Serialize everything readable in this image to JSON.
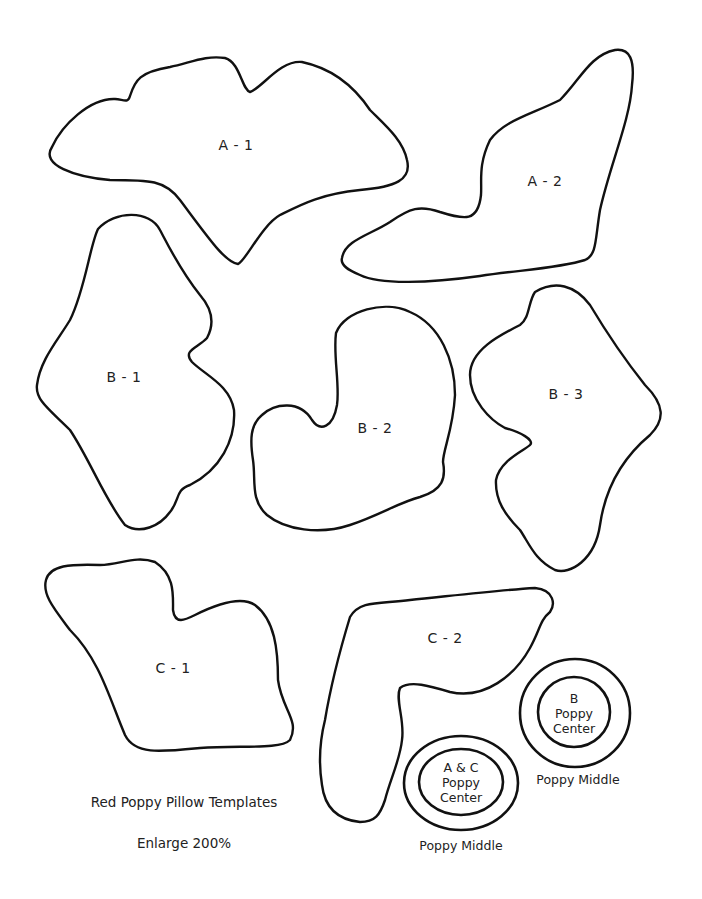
{
  "document": {
    "title": "Red Poppy Pillow Templates",
    "instruction": "Enlarge 200%"
  },
  "pieces": {
    "a1": {
      "label": "A - 1"
    },
    "a2": {
      "label": "A - 2"
    },
    "b1": {
      "label": "B - 1"
    },
    "b2": {
      "label": "B - 2"
    },
    "b3": {
      "label": "B - 3"
    },
    "c1": {
      "label": "C - 1"
    },
    "c2": {
      "label": "C - 2"
    }
  },
  "circles": {
    "b_center": {
      "line1": "B",
      "line2": "Poppy",
      "line3": "Center",
      "ring_label": "Poppy Middle"
    },
    "ac_center": {
      "line1": "A & C",
      "line2": "Poppy",
      "line3": "Center",
      "ring_label": "Poppy Middle"
    }
  },
  "colors": {
    "stroke": "#111111",
    "background": "#ffffff",
    "text": "#222222"
  }
}
